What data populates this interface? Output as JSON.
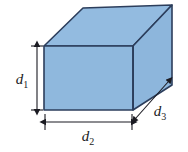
{
  "figure": {
    "kind": "geometry-diagram",
    "width": 188,
    "height": 152,
    "background_color": "#FFFFFF"
  },
  "solid": {
    "name": "rectangular-box",
    "faces": [
      {
        "name": "front-face",
        "fill": "#8FB8DD",
        "stroke": "#2C3E5C",
        "points": "44,46 133,46 133,110 44,110"
      },
      {
        "name": "top-face",
        "fill": "#93BBE0",
        "stroke": "#2C3E5C",
        "points": "44,46 83,8 172,5 133,46"
      },
      {
        "name": "right-face",
        "fill": "#8DB6DC",
        "stroke": "#2C3E5C",
        "points": "133,46 172,5 172,85 133,110"
      }
    ],
    "edge_color": "#2C3E5C",
    "edge_width": 1.6
  },
  "dimensions": [
    {
      "name": "height-dimension",
      "label": "d",
      "subscript": "1",
      "orientation": "vertical",
      "line": {
        "x1": 37,
        "y1": 47,
        "x2": 37,
        "y2": 109
      },
      "tick_extent": 6,
      "label_position": {
        "x": 22,
        "y": 84
      }
    },
    {
      "name": "width-dimension",
      "label": "d",
      "subscript": "2",
      "orientation": "horizontal",
      "line": {
        "x1": 45,
        "y1": 122,
        "x2": 132,
        "y2": 122
      },
      "tick_extent": 6,
      "label_position": {
        "x": 88,
        "y": 140
      }
    },
    {
      "name": "depth-dimension",
      "label": "d",
      "subscript": "3",
      "orientation": "diagonal",
      "line": {
        "x1": 135,
        "y1": 119,
        "x2": 169,
        "y2": 81
      },
      "tick_extent": 0,
      "label_position": {
        "x": 160,
        "y": 115
      }
    }
  ],
  "colors": {
    "face_blue": "#8FB8DD",
    "edge_navy": "#2C3E5C",
    "annotation_ink": "#1B1B22",
    "paper": "#FFFFFF"
  },
  "annotation_stroke_width": 1.1
}
